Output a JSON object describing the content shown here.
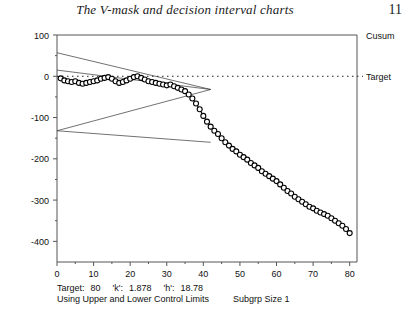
{
  "header": {
    "book_title": "The V-mask and decision interval charts",
    "page_number": "11"
  },
  "chart_data": {
    "type": "line",
    "title": "",
    "xlabel": "",
    "ylabel": "",
    "xlim": [
      0,
      82
    ],
    "ylim": [
      -450,
      100
    ],
    "grid": false,
    "marker": "open-circle",
    "axis_labels": {
      "right_top": "Cusum",
      "right_target": "Target"
    },
    "ytick_labels": [
      "100",
      "0",
      "-100",
      "-200",
      "-300",
      "-400"
    ],
    "yticks": [
      100,
      0,
      -100,
      -200,
      -300,
      -400
    ],
    "yminor_step": 50,
    "xtick_labels": [
      "0",
      "10",
      "20",
      "30",
      "40",
      "50",
      "60",
      "70",
      "80"
    ],
    "xticks": [
      0,
      10,
      20,
      30,
      40,
      50,
      60,
      70,
      80
    ],
    "xminor_step": 5,
    "series": [
      {
        "name": "Cusum",
        "x": [
          1,
          2,
          3,
          4,
          5,
          6,
          7,
          8,
          9,
          10,
          11,
          12,
          13,
          14,
          15,
          16,
          17,
          18,
          19,
          20,
          21,
          22,
          23,
          24,
          25,
          26,
          27,
          28,
          29,
          30,
          31,
          32,
          33,
          34,
          35,
          36,
          37,
          38,
          39,
          40,
          41,
          42,
          43,
          44,
          45,
          46,
          47,
          48,
          49,
          50,
          51,
          52,
          53,
          54,
          55,
          56,
          57,
          58,
          59,
          60,
          61,
          62,
          63,
          64,
          65,
          66,
          67,
          68,
          69,
          70,
          71,
          72,
          73,
          74,
          75,
          76,
          77,
          78,
          79,
          80
        ],
        "values": [
          -5,
          -10,
          -12,
          -14,
          -12,
          -16,
          -18,
          -16,
          -14,
          -12,
          -10,
          -6,
          -4,
          -2,
          -6,
          -12,
          -16,
          -14,
          -10,
          -6,
          -2,
          0,
          -4,
          -8,
          -12,
          -14,
          -16,
          -18,
          -20,
          -22,
          -20,
          -24,
          -28,
          -32,
          -36,
          -44,
          -54,
          -66,
          -80,
          -96,
          -110,
          -122,
          -132,
          -140,
          -150,
          -160,
          -168,
          -176,
          -182,
          -190,
          -196,
          -202,
          -210,
          -216,
          -222,
          -230,
          -236,
          -242,
          -248,
          -254,
          -262,
          -270,
          -278,
          -284,
          -292,
          -298,
          -304,
          -310,
          -316,
          -320,
          -326,
          -330,
          -334,
          -338,
          -344,
          -350,
          -356,
          -362,
          -370,
          -380
        ]
      }
    ],
    "target_line": {
      "label": "Target",
      "value": 0,
      "style": "dotted"
    },
    "vmask": {
      "vertex_x": 42,
      "vertex_y": -32,
      "upper_arm_start": [
        0,
        57
      ],
      "lower_arm_start": [
        0,
        -132
      ],
      "lower_divergent_end": [
        42,
        -160
      ]
    }
  },
  "footnote": {
    "target_label": "Target:",
    "target_value": "80",
    "k_label": "'k':",
    "k_value": "1.878",
    "h_label": "'h':",
    "h_value": "18.78",
    "limits_text": "Using Upper and Lower Control Limits",
    "subgroup_text": "Subgrp Size 1"
  }
}
